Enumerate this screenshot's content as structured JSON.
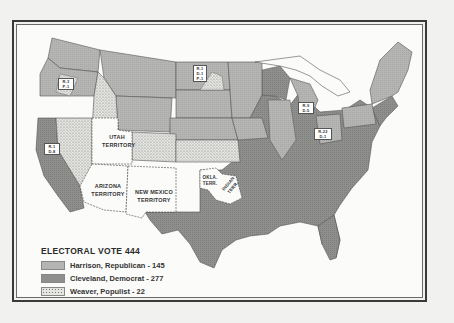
{
  "map": {
    "subject": "Presidential election electoral vote map, United States",
    "colors": {
      "harrison": "#b3b3b1",
      "cleveland": "#8e8e8c",
      "weaver": "#e2e2df",
      "territory": "#fbfbfa",
      "border": "#555555"
    }
  },
  "territories": {
    "utah": [
      "UTAH",
      "TERRITORY"
    ],
    "arizona": [
      "ARIZONA",
      "TERRITORY"
    ],
    "new_mexico": [
      "NEW MEXICO",
      "TERRITORY"
    ],
    "oklahoma": [
      "OKLA.",
      "TERR."
    ],
    "indian": [
      "INDIAN",
      "TERR."
    ]
  },
  "split_vote_boxes": {
    "oregon": [
      "R-3",
      "P-1"
    ],
    "california": [
      "R-1",
      "D-8"
    ],
    "north_dakota": [
      "R-1",
      "D-1",
      "P-1"
    ],
    "michigan": [
      "R-9",
      "D-5"
    ],
    "ohio": [
      "R-22",
      "D-1"
    ]
  },
  "legend": {
    "title": "ELECTORAL VOTE 444",
    "items": [
      {
        "label": "Harrison, Republican - 145",
        "party": "harrison"
      },
      {
        "label": "Cleveland, Democrat - 277",
        "party": "cleveland"
      },
      {
        "label": "Weaver, Populist - 22",
        "party": "weaver"
      }
    ]
  }
}
